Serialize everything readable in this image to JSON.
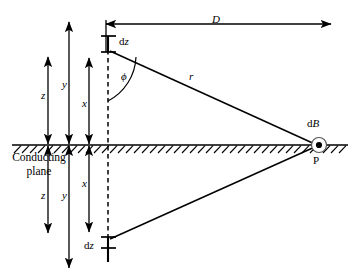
{
  "figure": {
    "background_color": "#ffffff",
    "line_color": "#000000",
    "width": 358,
    "height": 278
  },
  "labels": {
    "distance_D": "D",
    "element_top": {
      "upright": "d",
      "italic": "z"
    },
    "element_bottom": {
      "upright": "d",
      "italic": "z"
    },
    "angle_phi": "ϕ",
    "radius_r": "r",
    "field_dB": {
      "upright": "d",
      "italic": "B"
    },
    "point_P": "P",
    "conducting_plane_line1": "Conducting",
    "conducting_plane_line2": "plane",
    "dim_z_upper": "z",
    "dim_y_upper": "y",
    "dim_x_upper": "x",
    "dim_z_lower": "z",
    "dim_y_lower": "y",
    "dim_x_lower": "x"
  },
  "geometry": {
    "plane_y": 145,
    "axis_x": 108,
    "point_P_x": 318,
    "point_P_y": 145,
    "element_top_y": 48,
    "element_bottom_y": 245,
    "dimension_D_left": 106,
    "dimension_D_right": 331,
    "dimension_D_y": 24
  },
  "icons": {
    "dot_out_of_page": "field-direction-out-of-page-dot",
    "hatching": "ground-hatching"
  }
}
